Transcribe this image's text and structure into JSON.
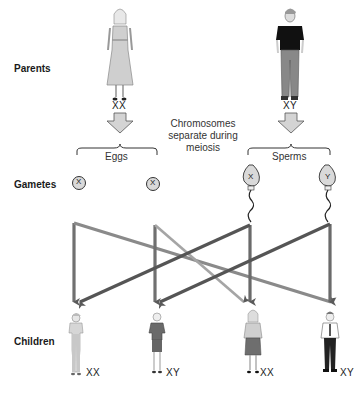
{
  "rows": {
    "parents": "Parents",
    "gametes": "Gametes",
    "children": "Children"
  },
  "parents": {
    "mother": {
      "genotype": "XX"
    },
    "father": {
      "genotype": "XY"
    }
  },
  "caption": {
    "line1": "Chromosomes",
    "line2": "separate during",
    "line3": "meiosis"
  },
  "gametes": {
    "eggs_label": "Eggs",
    "sperms_label": "Sperms",
    "eggs": [
      {
        "chromosome": "X"
      },
      {
        "chromosome": "X"
      }
    ],
    "sperms": [
      {
        "chromosome": "X"
      },
      {
        "chromosome": "Y"
      }
    ]
  },
  "children": [
    {
      "genotype": "XX",
      "sex": "female"
    },
    {
      "genotype": "XY",
      "sex": "male"
    },
    {
      "genotype": "XX",
      "sex": "female"
    },
    {
      "genotype": "XY",
      "sex": "male"
    }
  ],
  "colors": {
    "arrow_dark": "#6e6e6e",
    "arrow_light": "#9a9a9a",
    "gamete_fill": "#d9d9d9",
    "block_arrow_fill": "#d4d4d4"
  }
}
